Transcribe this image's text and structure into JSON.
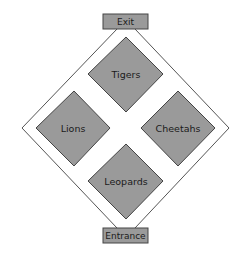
{
  "diagram": {
    "type": "zoo-map",
    "colors": {
      "background": "#ffffff",
      "path_outline": "#555555",
      "enclosure_fill": "#9a9a9a",
      "enclosure_stroke": "#444444",
      "box_fill": "#9a9a9a",
      "box_stroke": "#444444",
      "text": "#1a1a1a"
    },
    "exit": {
      "label": "Exit"
    },
    "entrance": {
      "label": "Entrance"
    },
    "enclosures": [
      {
        "id": "tigers",
        "label": "Tigers",
        "position": "top"
      },
      {
        "id": "lions",
        "label": "Lions",
        "position": "left"
      },
      {
        "id": "cheetahs",
        "label": "Cheetahs",
        "position": "right"
      },
      {
        "id": "leopards",
        "label": "Leopards",
        "position": "bottom"
      }
    ]
  }
}
